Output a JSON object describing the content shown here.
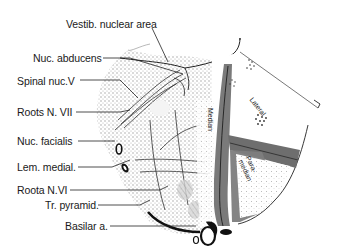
{
  "figure": {
    "type": "anatomical cross-section (pons, level of facial nucleus)",
    "labels": [
      {
        "id": "vestib",
        "text": "Vestib. nuclear area"
      },
      {
        "id": "abducens",
        "text": "Nuc. abducens"
      },
      {
        "id": "spinal",
        "text": "Spinal nuc.V"
      },
      {
        "id": "roots7",
        "text": "Roots N. VII"
      },
      {
        "id": "facialis",
        "text": "Nuc. facialis"
      },
      {
        "id": "lemniscus",
        "text": "Lem. medial."
      },
      {
        "id": "roots6",
        "text": "Roota N.VI"
      },
      {
        "id": "pyramid",
        "text": "Tr. pyramid."
      },
      {
        "id": "basilar",
        "text": "Basilar a."
      }
    ],
    "territories": {
      "lateral": "Lateral",
      "median": "Median",
      "paramedian": "Para-\nmedian"
    },
    "colors": {
      "ink": "#1a1a1a",
      "stipple": "#b5b5b5",
      "band": "#6e6e6e",
      "background": "#ffffff"
    }
  }
}
